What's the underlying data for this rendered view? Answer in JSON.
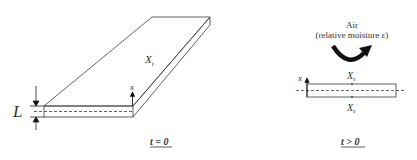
{
  "left_panel": {
    "slab_label": "X",
    "slab_label_sub": "i",
    "thickness_label": "L",
    "axis_label": "x",
    "time_label": "t = 0"
  },
  "right_panel": {
    "environment_line1": "Air",
    "environment_line2": "(relative moisture ε)",
    "axis_label": "x",
    "top_surface_label": "X",
    "top_surface_sub": "s",
    "bottom_surface_label": "X",
    "bottom_surface_sub": "s",
    "time_label": "t > 0"
  },
  "colors": {
    "line": "#3a3a3a",
    "text": "#333333",
    "arrow_fill": "#111111"
  }
}
